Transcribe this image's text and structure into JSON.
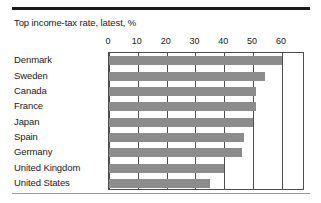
{
  "figure": {
    "title": "Top income-tax rate, latest, %",
    "rule_color": "#1a1a1a",
    "baseline_color": "#9a9a9a"
  },
  "chart_data": {
    "type": "bar",
    "orientation": "horizontal",
    "title": "Top income-tax rate, latest, %",
    "xlabel": "",
    "ylabel": "",
    "xlim": [
      0,
      68
    ],
    "xticks": [
      0,
      10,
      20,
      30,
      40,
      50,
      60
    ],
    "xticklabels": [
      "0",
      "10",
      "20",
      "30",
      "40",
      "50",
      "60"
    ],
    "tick_position": "top",
    "grid": "vertical",
    "legend": "none",
    "bar_color": "#8c8c8c",
    "categories": [
      "Denmark",
      "Sweden",
      "Canada",
      "France",
      "Japan",
      "Spain",
      "Germany",
      "United Kingdom",
      "United States"
    ],
    "values": [
      60,
      54,
      51,
      51,
      50,
      47,
      46,
      40,
      35
    ]
  }
}
